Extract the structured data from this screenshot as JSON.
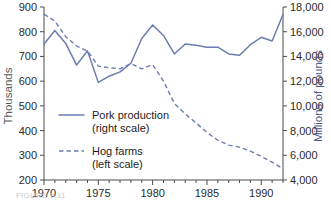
{
  "chart_data": {
    "type": "line",
    "title": "",
    "xlabel": "",
    "ylabel": "Thousands",
    "y2label": "Millions of pounds",
    "x": [
      1970,
      1971,
      1972,
      1973,
      1974,
      1975,
      1976,
      1977,
      1978,
      1979,
      1980,
      1981,
      1982,
      1983,
      1984,
      1985,
      1986,
      1987,
      1988,
      1989,
      1990,
      1991,
      1992
    ],
    "xlim": [
      1970,
      1992
    ],
    "xticks": [
      1970,
      1975,
      1980,
      1985,
      1990
    ],
    "xticklabels": [
      "1970",
      "1975",
      "1980",
      "1985",
      "1990"
    ],
    "xminorticks": [
      1971,
      1972,
      1973,
      1974,
      1976,
      1977,
      1978,
      1979,
      1981,
      1982,
      1983,
      1984,
      1986,
      1987,
      1988,
      1989,
      1991,
      1992
    ],
    "ylim": [
      200,
      900
    ],
    "yticks": [
      200,
      300,
      400,
      500,
      600,
      700,
      800,
      900
    ],
    "yticklabels": [
      "200",
      "300",
      "400",
      "500",
      "600",
      "700",
      "800",
      "900"
    ],
    "y2lim": [
      4000,
      18000
    ],
    "y2ticks": [
      4000,
      6000,
      8000,
      10000,
      12000,
      14000,
      16000,
      18000
    ],
    "y2ticklabels": [
      "4,000",
      "6,000",
      "8,000",
      "10,000",
      "12,000",
      "14,000",
      "16,000",
      "18,000"
    ],
    "grid": false,
    "legend_position": "center-left",
    "series": [
      {
        "name": "Pork production",
        "scale_note": "(right scale)",
        "axis": "right",
        "style": "solid",
        "color": "#6b7cb0",
        "values": [
          15000,
          16100,
          15050,
          13300,
          14450,
          11900,
          12400,
          12750,
          13450,
          15450,
          16550,
          15700,
          14200,
          15000,
          14900,
          14750,
          14750,
          14200,
          14100,
          14950,
          15550,
          15250,
          17400
        ]
      },
      {
        "name": "Hog farms",
        "scale_note": "(left scale)",
        "axis": "left",
        "style": "dashed",
        "color": "#6b7cb0",
        "values": [
          871,
          843,
          780,
          742,
          722,
          661,
          654,
          650,
          671,
          650,
          667,
          600,
          510,
          467,
          431,
          392,
          361,
          341,
          333,
          317,
          295,
          272,
          246
        ]
      }
    ]
  },
  "legend": {
    "entries": [
      {
        "label": "Pork production",
        "sub": "(right scale)",
        "style": "solid"
      },
      {
        "label": "Hog farms",
        "sub": "(left scale)",
        "style": "dashed"
      }
    ]
  },
  "caption": {
    "text": "FIGURE 9.11"
  }
}
